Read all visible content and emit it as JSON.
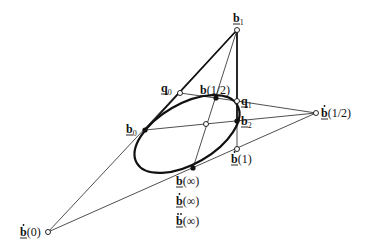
{
  "diagram": {
    "points": {
      "b1": {
        "base": "b",
        "sub": "1",
        "deco": "",
        "arg": ""
      },
      "q0": {
        "base": "q",
        "sub": "0",
        "deco": "",
        "arg": ""
      },
      "q1": {
        "base": "q",
        "sub": "1",
        "deco": "",
        "arg": ""
      },
      "b_half": {
        "base": "b",
        "sub": "",
        "deco": "",
        "arg": "(1/2)"
      },
      "b0": {
        "base": "b",
        "sub": "0",
        "deco": "",
        "arg": ""
      },
      "b2": {
        "base": "b",
        "sub": "2",
        "deco": "",
        "arg": ""
      },
      "bdot_half": {
        "base": "b",
        "sub": "",
        "deco": "dot",
        "arg": "(1/2)"
      },
      "bdot_1": {
        "base": "b",
        "sub": "",
        "deco": "dot",
        "arg": "(1)"
      },
      "b_inf": {
        "base": "b",
        "sub": "",
        "deco": "",
        "arg": "(∞)"
      },
      "bdot_inf": {
        "base": "b",
        "sub": "",
        "deco": "dot",
        "arg": "(∞)"
      },
      "bddot_inf": {
        "base": "b",
        "sub": "",
        "deco": "ddot",
        "arg": "(∞)"
      },
      "bdot_0": {
        "base": "b",
        "sub": "",
        "deco": "dot",
        "arg": "(0)"
      }
    }
  }
}
